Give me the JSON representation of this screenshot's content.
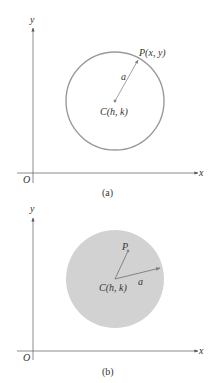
{
  "figure": {
    "colors": {
      "axis": "#6e6e6e",
      "circle_stroke": "#9a9a9a",
      "disk_fill": "#d2d2d2",
      "radius_line": "#8a8a8a",
      "point": "#8a8a8a",
      "text": "#333333"
    },
    "panel_a": {
      "caption": "(a)",
      "axis_x_label": "x",
      "axis_y_label": "y",
      "origin_label": "O",
      "center_label": "C(h,  k)",
      "point_label": "P(x,  y)",
      "radius_label": "a",
      "description": "Circle with center C(h, k) and radius a; P(x, y) lies on the circle"
    },
    "panel_b": {
      "caption": "(b)",
      "axis_x_label": "x",
      "axis_y_label": "y",
      "origin_label": "O",
      "center_label": "C(h,  k)",
      "point_label": "P",
      "radius_label": "a",
      "description": "Disk with center C(h, k) and radius a; P lies inside the disk"
    }
  }
}
